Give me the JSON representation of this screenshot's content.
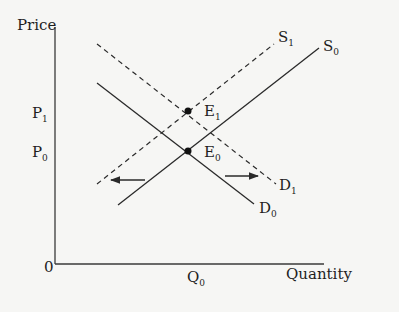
{
  "diagram": {
    "type": "supply-demand",
    "y_axis_title": "Price",
    "x_axis_title": "Quantity",
    "origin_label": "0",
    "price_labels": [
      {
        "base": "P",
        "sub": "1"
      },
      {
        "base": "P",
        "sub": "0"
      }
    ],
    "quantity_labels": [
      {
        "base": "Q",
        "sub": "0"
      }
    ],
    "curves": [
      {
        "name": "S",
        "sub": "0",
        "style": "solid",
        "kind": "supply"
      },
      {
        "name": "S",
        "sub": "1",
        "style": "dashed",
        "kind": "supply"
      },
      {
        "name": "D",
        "sub": "0",
        "style": "solid",
        "kind": "demand"
      },
      {
        "name": "D",
        "sub": "1",
        "style": "dashed",
        "kind": "demand"
      }
    ],
    "points": [
      {
        "name": "E",
        "sub": "1"
      },
      {
        "name": "E",
        "sub": "0"
      }
    ],
    "arrows": [
      {
        "direction": "left",
        "meaning": "supply shift"
      },
      {
        "direction": "right",
        "meaning": "demand shift"
      }
    ],
    "colors": {
      "line": "#2a2a2a",
      "background": "#f6f6f4"
    }
  }
}
